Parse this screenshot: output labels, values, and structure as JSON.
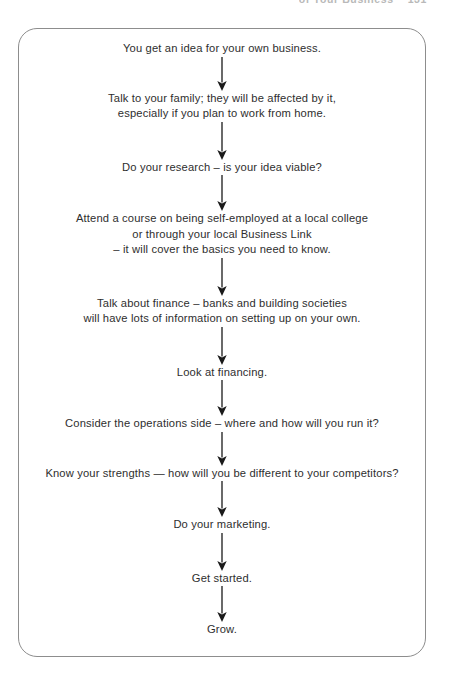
{
  "running_head": {
    "title": "of Your Business",
    "page_number": "131"
  },
  "diagram": {
    "name": "starting-a-business-flowchart",
    "arrow_color": "#1a1a1a",
    "border_color": "#8d8d8d",
    "text_color": "#2e2e2e",
    "steps": [
      {
        "id": "idea",
        "text": "You get an idea for your own business."
      },
      {
        "id": "family",
        "text": "Talk to your family; they will be affected by it,\nespecially if you plan to work from home."
      },
      {
        "id": "research",
        "text": "Do your research – is your idea viable?"
      },
      {
        "id": "course",
        "text": "Attend a course on being self-employed at a local college\nor through your local Business Link\n– it will cover the basics you need to know."
      },
      {
        "id": "finance",
        "text": "Talk about finance – banks and building societies\nwill have lots of information on setting up on your own."
      },
      {
        "id": "financing",
        "text": "Look at financing."
      },
      {
        "id": "operations",
        "text": "Consider the operations side – where and how will you run it?"
      },
      {
        "id": "strengths",
        "text": "Know your strengths — how will you be different to your competitors?"
      },
      {
        "id": "marketing",
        "text": "Do your marketing."
      },
      {
        "id": "get-started",
        "text": "Get started."
      },
      {
        "id": "grow",
        "text": "Grow."
      }
    ],
    "connectors": [
      {
        "id": "arrow-idea-to-family",
        "length": 34
      },
      {
        "id": "arrow-family-to-research",
        "length": 38
      },
      {
        "id": "arrow-research-to-course",
        "length": 36
      },
      {
        "id": "arrow-course-to-finance",
        "length": 38
      },
      {
        "id": "arrow-finance-to-financing",
        "length": 38
      },
      {
        "id": "arrow-financing-to-operations",
        "length": 36
      },
      {
        "id": "arrow-operations-to-strengths",
        "length": 34
      },
      {
        "id": "arrow-strengths-to-marketing",
        "length": 36
      },
      {
        "id": "arrow-marketing-to-get-started",
        "length": 38
      },
      {
        "id": "arrow-get-started-to-grow",
        "length": 36
      }
    ]
  }
}
